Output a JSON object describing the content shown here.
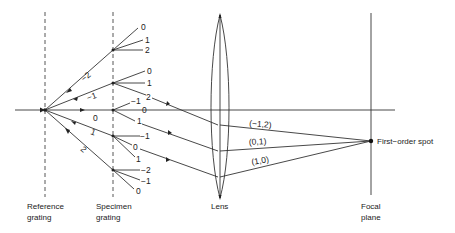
{
  "labels": {
    "reference_grating": [
      "Reference",
      "grating"
    ],
    "specimen_grating": [
      "Specimen",
      "grating"
    ],
    "lens": "Lens",
    "focal_plane": [
      "Focal",
      "plane"
    ],
    "first_order_spot": "First-order spot"
  },
  "reference_orders": [
    "-2",
    "-1",
    "0",
    "1",
    "2"
  ],
  "specimen_orders": {
    "from_ref_-2": [
      "0",
      "1",
      "2"
    ],
    "from_ref_-1": [
      "0",
      "1",
      "2"
    ],
    "from_ref_0": [
      "-1",
      "0",
      "1"
    ],
    "from_ref_1": [
      "-1",
      "0",
      "1"
    ],
    "from_ref_2": [
      "-2",
      "-1",
      "0"
    ]
  },
  "beam_labels": [
    "(-1,2)",
    "(0,1)",
    "(1,0)"
  ]
}
